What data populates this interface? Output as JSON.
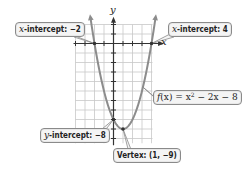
{
  "chart_data": {
    "type": "line",
    "title": "",
    "function": "f(x) = x^2 - 2x - 8",
    "xlabel": "x",
    "ylabel": "y",
    "xlim": [
      -4,
      4.2
    ],
    "ylim": [
      -10.5,
      2
    ],
    "grid": true,
    "x": [
      -2.4,
      -2,
      -1,
      0,
      1,
      2,
      3,
      4,
      4.4
    ],
    "values": [
      1.76,
      0,
      -5,
      -8,
      -9,
      -8,
      -5,
      0,
      2.56
    ],
    "annotations": [
      {
        "label": "x-intercept: −2",
        "point": [
          -2,
          0
        ]
      },
      {
        "label": "x-intercept: 4",
        "point": [
          4,
          0
        ]
      },
      {
        "label": "y-intercept: −8",
        "point": [
          0,
          -8
        ]
      },
      {
        "label": "Vertex: (1, −9)",
        "point": [
          1,
          -9
        ]
      },
      {
        "label": "f(x) = x² − 2x − 8",
        "point": [
          3,
          -5
        ]
      }
    ]
  },
  "labels": {
    "x_axis": "x",
    "y_axis": "y",
    "x_intercept_left_prefix": "x",
    "x_intercept_left_text": "-intercept: −2",
    "x_intercept_right_prefix": "x",
    "x_intercept_right_text": "-intercept: 4",
    "y_intercept_prefix": "y",
    "y_intercept_text": "-intercept: −8",
    "vertex": "Vertex: (1, −9)",
    "function_f": "f",
    "function_x": "(x) = x",
    "function_exp": "2",
    "function_rest": " − 2x − 8"
  },
  "colors": {
    "curve": "#8c8c8c",
    "axis": "#333333",
    "grid": "#c8c8c8",
    "callout_bg": "#f4f4f4",
    "callout_border": "#8a8a8a"
  }
}
